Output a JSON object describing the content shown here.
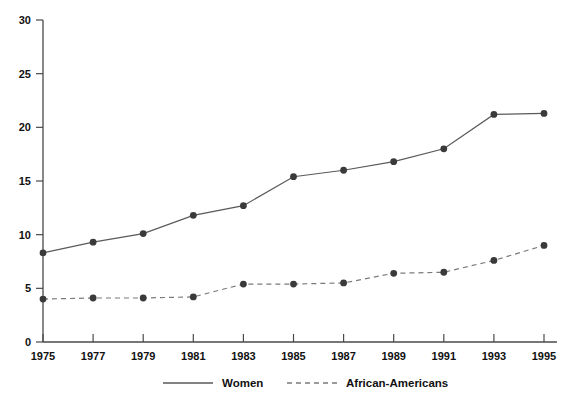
{
  "chart_data": {
    "type": "line",
    "title": "",
    "subtitle": "",
    "xlabel": "",
    "ylabel": "",
    "categories": [
      "1975",
      "1977",
      "1979",
      "1981",
      "1983",
      "1985",
      "1987",
      "1989",
      "1991",
      "1993",
      "1995"
    ],
    "x": [
      1975,
      1977,
      1979,
      1981,
      1983,
      1985,
      1987,
      1989,
      1991,
      1993,
      1995
    ],
    "series": [
      {
        "name": "Women",
        "style": "solid",
        "color": "#5a5a5a",
        "values": [
          8.3,
          9.3,
          10.1,
          11.8,
          12.7,
          15.4,
          16.0,
          16.8,
          18.0,
          21.2,
          21.3
        ]
      },
      {
        "name": "African-Americans",
        "style": "dashed",
        "color": "#7a7a7a",
        "values": [
          4.0,
          4.1,
          4.1,
          4.2,
          5.4,
          5.4,
          5.5,
          6.4,
          6.5,
          7.6,
          9.0
        ]
      }
    ],
    "ylim": [
      0,
      30
    ],
    "xlim": [
      1975,
      1995
    ],
    "yticks": [
      0,
      5,
      10,
      15,
      20,
      25,
      30
    ],
    "ytick_labels": [
      "0",
      "5",
      "10",
      "15",
      "20",
      "25",
      "30"
    ],
    "xtick_labels": [
      "1975",
      "1977",
      "1979",
      "1981",
      "1983",
      "1985",
      "1987",
      "1989",
      "1991",
      "1993",
      "1995"
    ],
    "grid": false,
    "legend_position": "bottom",
    "legend": [
      "Women",
      "African-Americans"
    ]
  },
  "legend": {
    "items": [
      {
        "label": "Women",
        "marker": "solid-line-swatch"
      },
      {
        "label": "African-Americans",
        "marker": "dashed-line-swatch"
      }
    ]
  },
  "axes": {
    "y_axis_name": "y-axis",
    "x_axis_name": "x-axis"
  },
  "colors": {
    "background": "#ffffff",
    "axis": "#4a4a4a",
    "text": "#111111",
    "women_line": "#5a5a5a",
    "african_americans_line": "#7a7a7a",
    "marker": "#3a3a3a"
  }
}
